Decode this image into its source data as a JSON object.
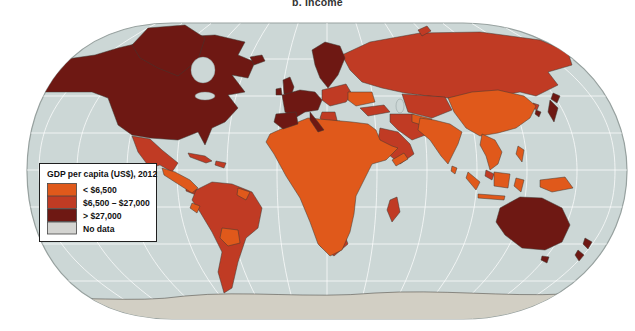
{
  "title": "b. Income",
  "legend": {
    "title": "GDP per capita (US$), 2012",
    "items": [
      {
        "label": "< $6,500",
        "color": "#E0591B"
      },
      {
        "label": "$6,500 – $27,000",
        "color": "#C03B24"
      },
      {
        "label": "> $27,000",
        "color": "#6E1813"
      },
      {
        "label": "No data",
        "color": "#D4D4D1"
      }
    ]
  },
  "map": {
    "projection": "world oval (Robinson-style)",
    "ocean_color": "#CCD7D6",
    "graticule_color": "#FFFFFF",
    "outline_color": "#97A19F",
    "antarctica_color": "#D2CFC4",
    "regions": [
      {
        "name": "Canada & United States",
        "category": "> $27,000"
      },
      {
        "name": "Greenland",
        "category": "> $27,000"
      },
      {
        "name": "Iceland",
        "category": "> $27,000"
      },
      {
        "name": "Western Europe & Scandinavia",
        "category": "> $27,000"
      },
      {
        "name": "Japan & South Korea",
        "category": "> $27,000"
      },
      {
        "name": "Australia & New Zealand",
        "category": "> $27,000"
      },
      {
        "name": "Mexico & Caribbean",
        "category": "$6,500 – $27,000"
      },
      {
        "name": "South America (most)",
        "category": "$6,500 – $27,000"
      },
      {
        "name": "Russia & Kazakhstan",
        "category": "$6,500 – $27,000"
      },
      {
        "name": "Eastern Europe & Balkans",
        "category": "$6,500 – $27,000"
      },
      {
        "name": "Turkey, Iran & Saudi Arabia",
        "category": "$6,500 – $27,000"
      },
      {
        "name": "Algeria & Libya",
        "category": "$6,500 – $27,000"
      },
      {
        "name": "Gabon",
        "category": "$6,500 – $27,000"
      },
      {
        "name": "South Africa",
        "category": "$6,500 – $27,000"
      },
      {
        "name": "Madagascar",
        "category": "$6,500 – $27,000"
      },
      {
        "name": "Africa (most)",
        "category": "< $6,500"
      },
      {
        "name": "Ukraine",
        "category": "< $6,500"
      },
      {
        "name": "Central America",
        "category": "< $6,500"
      },
      {
        "name": "Ecuador, Bolivia, Paraguay, Guyana",
        "category": "< $6,500"
      },
      {
        "name": "Central Asia",
        "category": "< $6,500"
      },
      {
        "name": "China & Mongolia",
        "category": "< $6,500"
      },
      {
        "name": "India & South Asia",
        "category": "< $6,500"
      },
      {
        "name": "Southeast Asia, Indonesia & New Guinea",
        "category": "< $6,500"
      },
      {
        "name": "Antarctica",
        "category": "No data"
      }
    ]
  }
}
